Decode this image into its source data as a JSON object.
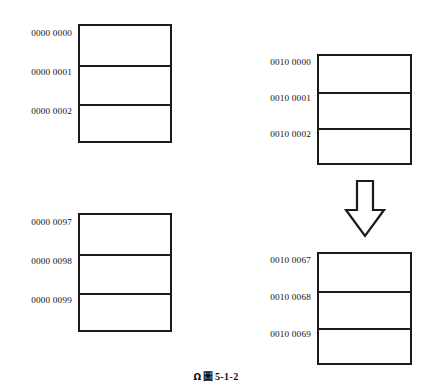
{
  "figure": {
    "caption_mark": "Ω",
    "caption_figure_glyph": "圖",
    "caption_number": "5-1-2",
    "background_color": "#ffffff",
    "line_color": "#1a1a1a",
    "text_color": "#111111"
  },
  "blocks": [
    {
      "id": "top-left",
      "name": "memory-block-top-left",
      "addresses": [
        "0000 0000",
        "0000 0001",
        "0000 0002"
      ],
      "rows": [
        "",
        "",
        ""
      ]
    },
    {
      "id": "bottom-left",
      "name": "memory-block-bottom-left",
      "addresses": [
        "0000 0097",
        "0000 0098",
        "0000 0099"
      ],
      "rows": [
        "",
        "",
        ""
      ]
    },
    {
      "id": "top-right",
      "name": "memory-block-top-right",
      "addresses": [
        "0010 0000",
        "0010 0001",
        "0010 0002"
      ],
      "rows": [
        "",
        "",
        ""
      ]
    },
    {
      "id": "bottom-right",
      "name": "memory-block-bottom-right",
      "addresses": [
        "0010 0067",
        "0010 0068",
        "0010 0069"
      ],
      "rows": [
        "",
        "",
        ""
      ]
    }
  ],
  "arrow": {
    "direction": "down",
    "style": "hollow-outline",
    "label": ""
  }
}
